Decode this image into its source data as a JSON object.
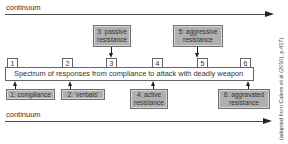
{
  "top_continuum": {
    "label": "continuum"
  },
  "bottom_continuum": {
    "label": "continuum"
  },
  "spectrum": {
    "label": "Spectrum of responses from compliance to attack with deadly weapon",
    "markers": [
      "1",
      "2",
      "3",
      "4",
      "5",
      "6"
    ]
  },
  "above_boxes": [
    {
      "id": 3,
      "line1": "3: passive",
      "line2": "resistance"
    },
    {
      "id": 5,
      "line1": "5: aggressive",
      "line2": "resistance"
    }
  ],
  "below_boxes": [
    {
      "id": 1,
      "line1": "1: compliance",
      "line2": ""
    },
    {
      "id": 2,
      "line1": "2: 'verbals'",
      "line2": ""
    },
    {
      "id": 4,
      "line1": "4: active",
      "line2": "resistance"
    },
    {
      "id": 6,
      "line1": "6: aggravated",
      "line2": "resistance"
    }
  ],
  "source_note": "(adapted from Caless et al (2010), p.417)",
  "colors": {
    "box_fill": "#b0b0b0",
    "line": "#4a4a4a",
    "arrow": "#222222"
  }
}
